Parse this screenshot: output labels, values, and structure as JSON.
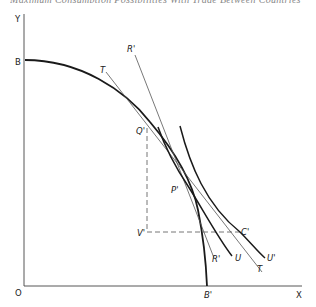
{
  "header": {
    "text": "Maximum Consumption Possibilities With Trade Between Countries"
  },
  "diagram": {
    "axes": {
      "y_label": "Y",
      "x_label": "X",
      "origin_label": "O"
    },
    "points": {
      "B": "B",
      "B_prime": "B'",
      "Q_prime": "Q'",
      "P_prime": "P'",
      "C_prime": "C'",
      "V_prime": "V'"
    },
    "lines": {
      "T_upper": "T",
      "T_lower": "T",
      "R_prime_upper": "R'",
      "R_prime_lower": "R'"
    },
    "curves": {
      "U": "U",
      "U_prime": "U'",
      "production_frontier": "BB'"
    },
    "colors": {
      "ink": "#1a1a1a",
      "thin_line": "#555555",
      "dashed": "#666666"
    }
  }
}
